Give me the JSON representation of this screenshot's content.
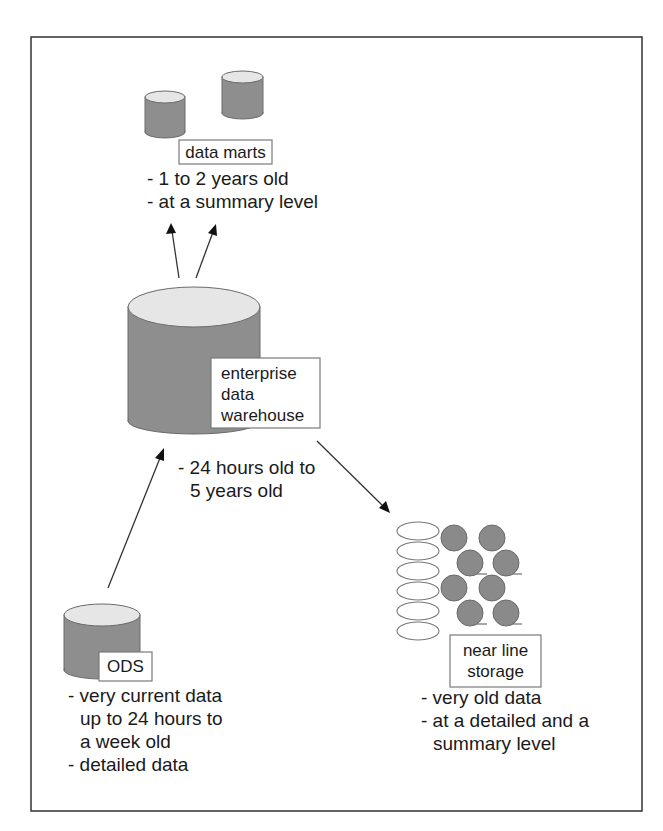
{
  "diagram": {
    "title": "",
    "nodes": {
      "data_marts": {
        "label": "data marts",
        "notes": [
          "- 1 to 2 years old",
          "- at a summary level"
        ]
      },
      "edw": {
        "label_lines": [
          "enterprise",
          "data",
          "warehouse"
        ],
        "notes": [
          "- 24 hours old to",
          "5 years old"
        ]
      },
      "ods": {
        "label": "ODS",
        "notes": [
          "- very current data",
          "up to 24 hours to",
          "a week old",
          "- detailed data"
        ]
      },
      "near_line": {
        "label_lines": [
          "near line",
          "storage"
        ],
        "notes": [
          "- very old data",
          "- at a detailed and a",
          "summary level"
        ]
      }
    },
    "edges": [
      {
        "from": "edw",
        "to": "data_marts"
      },
      {
        "from": "edw",
        "to": "data_marts"
      },
      {
        "from": "ods",
        "to": "edw"
      },
      {
        "from": "edw",
        "to": "near_line"
      }
    ],
    "colors": {
      "cylinder_body": "#8e8e8e",
      "cylinder_top": "#e6e6e6",
      "frame": "#333333"
    }
  }
}
